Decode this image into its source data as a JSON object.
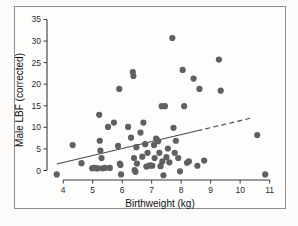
{
  "chart_data": {
    "type": "scatter",
    "title": "",
    "xlabel": "Birthweight (kg)",
    "ylabel": "Male LBF (corrected)",
    "xlim": [
      3.45,
      11.25
    ],
    "ylim": [
      -2.2,
      35.8
    ],
    "xticks": [
      4,
      5,
      6,
      7,
      8,
      9,
      10,
      11
    ],
    "xtick_labels": [
      "4",
      "5",
      "6",
      "7",
      "8",
      "9",
      "10",
      "11"
    ],
    "yticks": [
      0,
      5,
      10,
      15,
      20,
      25,
      30,
      35
    ],
    "ytick_labels": [
      "0",
      "5",
      "10",
      "15",
      "20",
      "25",
      "30",
      "35"
    ],
    "grid": false,
    "legend": "none",
    "marker_color": "#5f6062",
    "marker_size": 3.1,
    "trendline": {
      "type": "linear-fit",
      "solid_segment": {
        "x0": 3.78,
        "y0": 1.5,
        "x1": 8.55,
        "y1": 9.2
      },
      "dashed_segment": {
        "x0": 8.55,
        "y0": 9.2,
        "x1": 10.4,
        "y1": 12.2
      },
      "color": "#4a4a4a",
      "style": "solid-then-dashed"
    },
    "points": [
      [
        3.78,
        -0.9
      ],
      [
        4.32,
        5.9
      ],
      [
        4.62,
        1.7
      ],
      [
        4.98,
        0.5
      ],
      [
        5.05,
        0.6
      ],
      [
        5.12,
        0.5
      ],
      [
        5.18,
        0.5
      ],
      [
        5.22,
        12.9
      ],
      [
        5.24,
        6.9
      ],
      [
        5.26,
        4.6
      ],
      [
        5.3,
        2.9
      ],
      [
        5.34,
        0.5
      ],
      [
        5.42,
        0.6
      ],
      [
        5.52,
        10.1
      ],
      [
        5.58,
        0.6
      ],
      [
        5.72,
        11.1
      ],
      [
        5.86,
        5.7
      ],
      [
        5.9,
        18.9
      ],
      [
        5.92,
        1.6
      ],
      [
        5.94,
        1.3
      ],
      [
        5.96,
        -0.9
      ],
      [
        6.2,
        10.1
      ],
      [
        6.3,
        7.6
      ],
      [
        6.36,
        22.8
      ],
      [
        6.38,
        21.9
      ],
      [
        6.4,
        2.9
      ],
      [
        6.42,
        0.1
      ],
      [
        6.45,
        -0.3
      ],
      [
        6.48,
        5.4
      ],
      [
        6.5,
        1.6
      ],
      [
        6.62,
        8.8
      ],
      [
        6.68,
        3.2
      ],
      [
        6.72,
        11.1
      ],
      [
        6.78,
        6.1
      ],
      [
        6.82,
        0.9
      ],
      [
        6.86,
        4.1
      ],
      [
        6.9,
        1.1
      ],
      [
        6.95,
        1.2
      ],
      [
        7.02,
        1.1
      ],
      [
        7.08,
        5.9
      ],
      [
        7.1,
        2.9
      ],
      [
        7.15,
        7.4
      ],
      [
        7.18,
        7.1
      ],
      [
        7.22,
        6.8
      ],
      [
        7.26,
        4.1
      ],
      [
        7.3,
        1.0
      ],
      [
        7.34,
        14.9
      ],
      [
        7.36,
        2.1
      ],
      [
        7.4,
        -1.1
      ],
      [
        7.45,
        14.9
      ],
      [
        7.5,
        3.1
      ],
      [
        7.55,
        5.1
      ],
      [
        7.6,
        1.9
      ],
      [
        7.7,
        30.7
      ],
      [
        7.74,
        9.9
      ],
      [
        7.78,
        4.1
      ],
      [
        7.82,
        6.9
      ],
      [
        7.9,
        2.9
      ],
      [
        7.96,
        -0.2
      ],
      [
        8.05,
        23.3
      ],
      [
        8.1,
        14.9
      ],
      [
        8.2,
        1.8
      ],
      [
        8.26,
        2.1
      ],
      [
        8.42,
        21.3
      ],
      [
        8.55,
        1.1
      ],
      [
        8.62,
        18.9
      ],
      [
        8.78,
        2.3
      ],
      [
        9.28,
        25.7
      ],
      [
        9.34,
        18.5
      ],
      [
        10.58,
        8.2
      ],
      [
        10.85,
        -0.9
      ]
    ]
  }
}
